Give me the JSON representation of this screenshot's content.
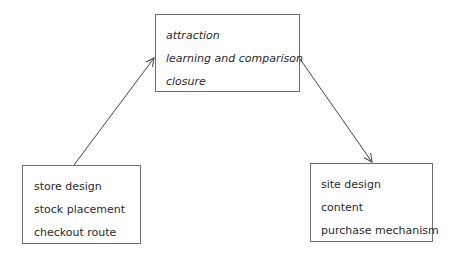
{
  "diagram": {
    "top_box": {
      "lines": [
        "attraction",
        "learning and comparison",
        "closure"
      ]
    },
    "left_box": {
      "lines": [
        "store design",
        "stock placement",
        "checkout route"
      ]
    },
    "right_box": {
      "lines": [
        "site design",
        "content",
        "purchase mechanism"
      ]
    },
    "arrows": [
      {
        "from": "left_box",
        "to": "top_box"
      },
      {
        "from": "top_box",
        "to": "right_box"
      }
    ],
    "colors": {
      "stroke": "#444444",
      "border": "#6f6f6f",
      "text": "#2a2a2a"
    }
  }
}
